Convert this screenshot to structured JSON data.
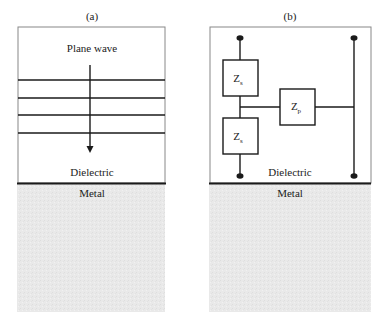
{
  "panels": [
    {
      "id": "a",
      "caption": "(a)",
      "top_label": "Plane wave",
      "dielectric_label": "Dielectric",
      "metal_label": "Metal",
      "wavefront_count": 4
    },
    {
      "id": "b",
      "caption": "(b)",
      "series_impedance_top": "Z",
      "series_impedance_top_sub": "s",
      "series_impedance_bottom": "Z",
      "series_impedance_bottom_sub": "s",
      "parallel_impedance": "Z",
      "parallel_impedance_sub": "p",
      "dielectric_label": "Dielectric",
      "metal_label": "Metal"
    }
  ],
  "colors": {
    "line": "#1a1a1a",
    "metal_fill": "#e8e8e8",
    "border": "#888888"
  }
}
